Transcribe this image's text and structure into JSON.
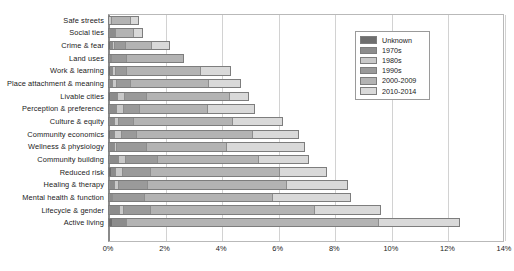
{
  "chart_data": {
    "type": "bar",
    "orientation": "horizontal",
    "stacked": true,
    "title": "",
    "xlabel": "",
    "ylabel": "",
    "xlim": [
      0,
      14
    ],
    "xunit": "%",
    "grid": true,
    "xticks": [
      "0%",
      "2%",
      "4%",
      "6%",
      "8%",
      "10%",
      "12%",
      "14%"
    ],
    "xtick_values": [
      0,
      2,
      4,
      6,
      8,
      10,
      12,
      14
    ],
    "legend_position": "top-right",
    "legend_title": "",
    "series": [
      {
        "name": "Unknown",
        "color": "#6e6e6e"
      },
      {
        "name": "1970s",
        "color": "#8c8c8c"
      },
      {
        "name": "1980s",
        "color": "#c9c9c9"
      },
      {
        "name": "1990s",
        "color": "#9a9a9a"
      },
      {
        "name": "2000-2009",
        "color": "#b3b3b3"
      },
      {
        "name": "2010-2014",
        "color": "#d9d9d9"
      }
    ],
    "categories": [
      "Safe streets",
      "Social ties",
      "Crime & fear",
      "Land uses",
      "Work & learning",
      "Place attachment & meaning",
      "Livable cities",
      "Perception & preference",
      "Culture & equity",
      "Community economics",
      "Wellness & physiology",
      "Community building",
      "Reduced risk",
      "Healing & therapy",
      "Mental health & function",
      "Lifecycle & gender",
      "Active living"
    ],
    "values": [
      [
        0.0,
        0.0,
        0.1,
        0.0,
        0.75,
        0.25
      ],
      [
        0.0,
        0.25,
        0.0,
        0.0,
        0.7,
        0.3
      ],
      [
        0.08,
        0.05,
        0.1,
        0.4,
        0.95,
        0.6
      ],
      [
        0.0,
        0.12,
        0.0,
        0.55,
        2.0,
        0.0
      ],
      [
        0.08,
        0.07,
        0.1,
        0.4,
        2.65,
        1.05
      ],
      [
        0.0,
        0.15,
        0.15,
        0.5,
        2.8,
        1.1
      ],
      [
        0.08,
        0.25,
        0.25,
        0.8,
        2.95,
        0.65
      ],
      [
        0.0,
        0.3,
        0.25,
        0.55,
        2.45,
        1.65
      ],
      [
        0.0,
        0.2,
        0.15,
        0.55,
        3.55,
        1.75
      ],
      [
        0.08,
        0.12,
        0.25,
        0.55,
        4.15,
        1.6
      ],
      [
        0.0,
        0.2,
        0.1,
        1.05,
        2.85,
        2.75
      ],
      [
        0.05,
        0.3,
        0.25,
        1.15,
        3.6,
        1.75
      ],
      [
        0.1,
        0.15,
        0.25,
        1.0,
        4.6,
        1.65
      ],
      [
        0.05,
        0.15,
        0.15,
        1.05,
        4.95,
        2.15
      ],
      [
        0.0,
        0.15,
        0.0,
        1.15,
        4.55,
        2.75
      ],
      [
        0.05,
        0.35,
        0.15,
        0.95,
        5.85,
        2.3
      ],
      [
        0.15,
        0.5,
        0.0,
        0.0,
        8.95,
        2.85
      ]
    ],
    "totals": [
      1.1,
      1.25,
      2.18,
      2.67,
      4.35,
      4.7,
      4.98,
      5.2,
      6.2,
      6.75,
      6.95,
      7.1,
      7.75,
      8.5,
      8.6,
      9.65,
      12.45
    ]
  }
}
